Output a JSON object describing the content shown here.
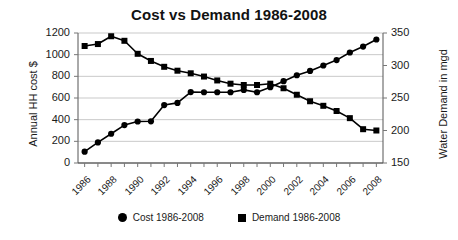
{
  "chart_data": {
    "type": "line",
    "title": "Cost vs Demand 1986-2008",
    "xlabel": "",
    "ylabel": "Annual HH cost $",
    "y2label": "Water Demand in mgd",
    "grid": true,
    "legend_position": "bottom",
    "ylim": [
      0,
      1200
    ],
    "y2lim": [
      150,
      350
    ],
    "yticks": [
      0,
      200,
      400,
      600,
      800,
      1000,
      1200
    ],
    "y2ticks": [
      150,
      200,
      250,
      300,
      350
    ],
    "x": [
      1986,
      1987,
      1988,
      1989,
      1990,
      1991,
      1992,
      1993,
      1994,
      1995,
      1996,
      1997,
      1998,
      1999,
      2000,
      2001,
      2002,
      2003,
      2004,
      2005,
      2006,
      2007,
      2008
    ],
    "xtick_labels": [
      "1986",
      "",
      "1988",
      "",
      "1990",
      "",
      "1992",
      "",
      "1994",
      "",
      "1996",
      "",
      "1998",
      "",
      "2000",
      "",
      "2002",
      "",
      "2004",
      "",
      "2006",
      "",
      "2008"
    ],
    "xtick_rotation": -45,
    "series": [
      {
        "name": "Cost 1986-2008",
        "axis": "left",
        "marker": "circle",
        "color": "#000000",
        "values": [
          105,
          190,
          270,
          350,
          383,
          385,
          535,
          555,
          655,
          653,
          653,
          653,
          675,
          653,
          700,
          755,
          810,
          850,
          900,
          950,
          1020,
          1075,
          1140
        ]
      },
      {
        "name": "Demand 1986-2008",
        "axis": "right",
        "marker": "square",
        "color": "#000000",
        "values": [
          330,
          333,
          345,
          338,
          318,
          307,
          298,
          292,
          288,
          283,
          277,
          272,
          270,
          270,
          272,
          265,
          255,
          245,
          238,
          230,
          219,
          202,
          200
        ]
      }
    ]
  },
  "legend": {
    "items": [
      {
        "label": "Cost 1986-2008",
        "marker": "circle"
      },
      {
        "label": "Demand 1986-2008",
        "marker": "square"
      }
    ]
  }
}
